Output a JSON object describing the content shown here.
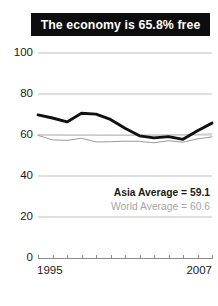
{
  "title": {
    "text": "The economy is 65.8% free"
  },
  "legend": {
    "asia": "Asia Average = 59.1",
    "world": "World Average = 60.6"
  },
  "axis": {
    "x_start_label": "1995",
    "x_end_label": "2007"
  },
  "colors": {
    "title_bar": "#0d0d0d",
    "title_text": "#ffffff",
    "country_line": "#111111",
    "asia_line": "#9a9a9a",
    "world_line": "#c4c4c4",
    "gridline": "#bfbfbf",
    "axis_text": "#1a1a1a",
    "legend_world_text": "#a6a6a6"
  },
  "chart_data": {
    "type": "line",
    "title": "The economy is 65.8% free",
    "xlabel": "",
    "ylabel": "",
    "xlim": [
      1995,
      2007
    ],
    "ylim": [
      0,
      100
    ],
    "yticks": [
      0,
      20,
      40,
      60,
      80,
      100
    ],
    "xticks": [
      1995,
      1996,
      1997,
      1998,
      1999,
      2000,
      2001,
      2002,
      2003,
      2004,
      2005,
      2006,
      2007
    ],
    "xtick_labels_shown": [
      "1995",
      "2007"
    ],
    "grid": true,
    "legend_position": "bottom-right",
    "x": [
      1995,
      1996,
      1997,
      1998,
      1999,
      2000,
      2001,
      2002,
      2003,
      2004,
      2005,
      2006,
      2007
    ],
    "series": [
      {
        "name": "Country",
        "color": "#111111",
        "values": [
          69.8,
          68.3,
          66.4,
          70.6,
          70.2,
          67.6,
          63.3,
          59.6,
          58.6,
          59.2,
          57.9,
          62.1,
          65.8
        ]
      },
      {
        "name": "Asia Average",
        "color": "#9a9a9a",
        "values": [
          59.8,
          57.6,
          57.4,
          58.4,
          56.6,
          56.7,
          57.0,
          56.9,
          56.2,
          57.2,
          56.5,
          58.1,
          59.1
        ]
      },
      {
        "name": "World Average",
        "color": "#c4c4c4",
        "values": [
          60.1,
          60.0,
          59.9,
          59.9,
          59.8,
          59.8,
          59.8,
          59.9,
          59.9,
          60.0,
          60.1,
          60.3,
          60.6
        ]
      }
    ],
    "annotations": [
      {
        "text": "Asia Average = 59.1",
        "value": 59.1
      },
      {
        "text": "World Average = 60.6",
        "value": 60.6
      }
    ]
  }
}
